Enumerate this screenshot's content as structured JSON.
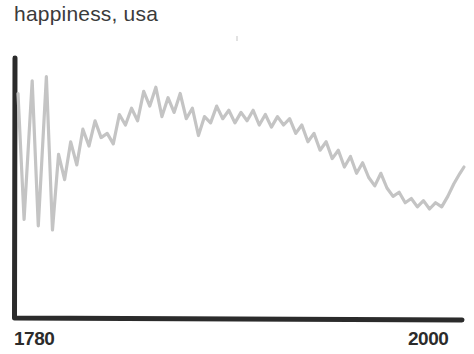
{
  "chart_data": {
    "type": "line",
    "title": "happiness, usa",
    "xlabel": "",
    "ylabel": "",
    "grid": false,
    "legend": null,
    "xlim": [
      1780,
      2000
    ],
    "ylim": [
      0,
      100
    ],
    "axis_color": "#2b2b2b",
    "line_color": "#c4c4c4",
    "x_tick_labels": [
      "1780",
      "2000"
    ],
    "x_ticks": [
      1780,
      2000
    ],
    "y_tick_labels": [],
    "annotations": [],
    "series": [
      {
        "name": "happiness",
        "x": [
          1780,
          1783,
          1787,
          1790,
          1794,
          1797,
          1800,
          1803,
          1806,
          1809,
          1812,
          1815,
          1818,
          1821,
          1824,
          1827,
          1830,
          1833,
          1836,
          1839,
          1842,
          1845,
          1848,
          1851,
          1854,
          1857,
          1860,
          1863,
          1866,
          1869,
          1872,
          1875,
          1878,
          1881,
          1884,
          1887,
          1890,
          1893,
          1896,
          1899,
          1902,
          1905,
          1908,
          1911,
          1914,
          1917,
          1920,
          1923,
          1926,
          1929,
          1932,
          1935,
          1938,
          1941,
          1944,
          1947,
          1950,
          1953,
          1956,
          1959,
          1962,
          1965,
          1968,
          1971,
          1974,
          1977,
          1980,
          1983,
          1986,
          1989,
          1992,
          1995,
          1998,
          2000
        ],
        "values": [
          85,
          25,
          91,
          22,
          93,
          20,
          56,
          44,
          62,
          51,
          68,
          60,
          72,
          64,
          66,
          61,
          75,
          70,
          78,
          72,
          86,
          79,
          88,
          74,
          83,
          76,
          85,
          73,
          78,
          65,
          74,
          71,
          79,
          73,
          77,
          71,
          76,
          72,
          77,
          70,
          75,
          69,
          74,
          70,
          73,
          66,
          70,
          62,
          66,
          58,
          62,
          54,
          58,
          50,
          55,
          47,
          52,
          45,
          41,
          47,
          40,
          36,
          38,
          33,
          35,
          31,
          34,
          30,
          33,
          31,
          36,
          42,
          47,
          50
        ]
      }
    ]
  },
  "footnote": ""
}
